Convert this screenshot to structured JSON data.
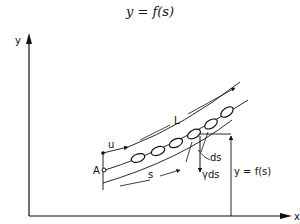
{
  "title": "y = f(s)",
  "axes": {
    "y_label": "y",
    "x_label": "x"
  },
  "labels": {
    "point_a": "A",
    "u": "u",
    "L": "L",
    "s": "s",
    "ds": "ds",
    "gamma_ds": "γds",
    "height": "y = f(s)"
  },
  "colors": {
    "ink": "#111111",
    "background": "#ffffff"
  }
}
